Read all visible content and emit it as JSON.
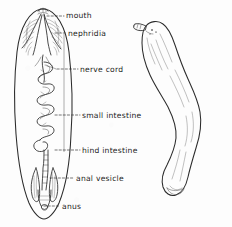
{
  "figure": {
    "background_color": "#fdfdfd",
    "ink_color": "#2b2b2b",
    "label_color": "#232323"
  },
  "left_figure": {
    "name": "dissected-internal-anatomy-view",
    "description": "Dorsal dissection showing internal organs inside an elongated oval body outline"
  },
  "right_figure": {
    "name": "external-whole-body-view",
    "description": "External lateral view of the whole curved animal with proboscis at the head"
  },
  "labels": [
    {
      "id": "mouth",
      "text": "mouth",
      "x": 66,
      "y": 18
    },
    {
      "id": "nephridia",
      "text": "nephridia",
      "x": 68,
      "y": 36
    },
    {
      "id": "nerve-cord",
      "text": "nerve cord",
      "x": 80,
      "y": 72
    },
    {
      "id": "small-intestine",
      "text": "small intestine",
      "x": 82,
      "y": 118
    },
    {
      "id": "hind-intestine",
      "text": "hind intestine",
      "x": 82,
      "y": 153
    },
    {
      "id": "anal-vesicle",
      "text": "anal vesicle",
      "x": 76,
      "y": 181
    },
    {
      "id": "anus",
      "text": "anus",
      "x": 62,
      "y": 209
    }
  ],
  "leader_lines": [
    {
      "id": "leader-mouth",
      "d": "M 47 16 L 64 16"
    },
    {
      "id": "leader-nephridia",
      "d": "M 55 33 L 66 33"
    },
    {
      "id": "leader-nerve-cord",
      "d": "M 57 69 L 78 69"
    },
    {
      "id": "leader-small-intestine",
      "d": "M 55 115 L 80 115"
    },
    {
      "id": "leader-hind-intestine",
      "d": "M 55 150 L 80 150"
    },
    {
      "id": "leader-anal-vesicle",
      "d": "M 50 178 L 74 178"
    },
    {
      "id": "leader-anus",
      "d": "M 44 206 L 60 206"
    }
  ],
  "leader_stem": {
    "id": "leader-stem",
    "d": "M 64 34 L 64 152"
  }
}
